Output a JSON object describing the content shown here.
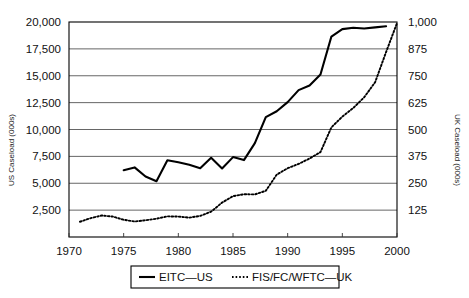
{
  "chart_data": {
    "type": "line",
    "title": "",
    "xlabel": "",
    "ylabel": "US Caseload (000s)",
    "y2label": "UK Caseload (000s)",
    "xlim": [
      1970,
      2000
    ],
    "ylim": [
      0,
      20000
    ],
    "y2lim": [
      0,
      1000
    ],
    "grid": true,
    "legend_position": "bottom",
    "xticks": [
      "1970",
      "1975",
      "1980",
      "1985",
      "1990",
      "1995",
      "2000"
    ],
    "xtick_values": [
      1970,
      1975,
      1980,
      1985,
      1990,
      1995,
      2000
    ],
    "yticks": [
      "2,500",
      "5,000",
      "7,500",
      "10,000",
      "12,500",
      "15,000",
      "17,500",
      "20,000"
    ],
    "ytick_values": [
      2500,
      5000,
      7500,
      10000,
      12500,
      15000,
      17500,
      20000
    ],
    "y2ticks": [
      "125",
      "250",
      "375",
      "500",
      "625",
      "750",
      "875",
      "1,000"
    ],
    "y2tick_values": [
      125,
      250,
      375,
      500,
      625,
      750,
      875,
      1000
    ],
    "series": [
      {
        "name": "EITC—US",
        "axis": "left",
        "style": "solid",
        "color": "#000000",
        "x": [
          1975,
          1976,
          1977,
          1978,
          1979,
          1980,
          1981,
          1982,
          1983,
          1984,
          1985,
          1986,
          1987,
          1988,
          1989,
          1990,
          1991,
          1992,
          1993,
          1994,
          1995,
          1996,
          1997,
          1998,
          1999
        ],
        "values": [
          6215,
          6473,
          5627,
          5192,
          7135,
          6954,
          6717,
          6395,
          7368,
          6376,
          7432,
          7156,
          8738,
          11148,
          11696,
          12542,
          13665,
          14097,
          15117,
          18647,
          19334,
          19464,
          19391,
          19500,
          19600
        ]
      },
      {
        "name": "FIS/FC/WFTC—UK",
        "axis": "right",
        "style": "dotted",
        "color": "#000000",
        "x": [
          1971,
          1972,
          1973,
          1974,
          1975,
          1976,
          1977,
          1978,
          1979,
          1980,
          1981,
          1982,
          1983,
          1984,
          1985,
          1986,
          1987,
          1988,
          1989,
          1990,
          1991,
          1992,
          1993,
          1994,
          1995,
          1996,
          1997,
          1998,
          1999,
          2000
        ],
        "values": [
          71,
          88,
          100,
          95,
          80,
          72,
          78,
          85,
          96,
          95,
          90,
          98,
          118,
          160,
          190,
          199,
          198,
          215,
          290,
          320,
          340,
          365,
          395,
          510,
          560,
          600,
          650,
          720,
          860,
          995
        ]
      }
    ],
    "legend": [
      {
        "label": "EITC—US",
        "style": "solid"
      },
      {
        "label": "FIS/FC/WFTC—UK",
        "style": "dotted"
      }
    ]
  }
}
